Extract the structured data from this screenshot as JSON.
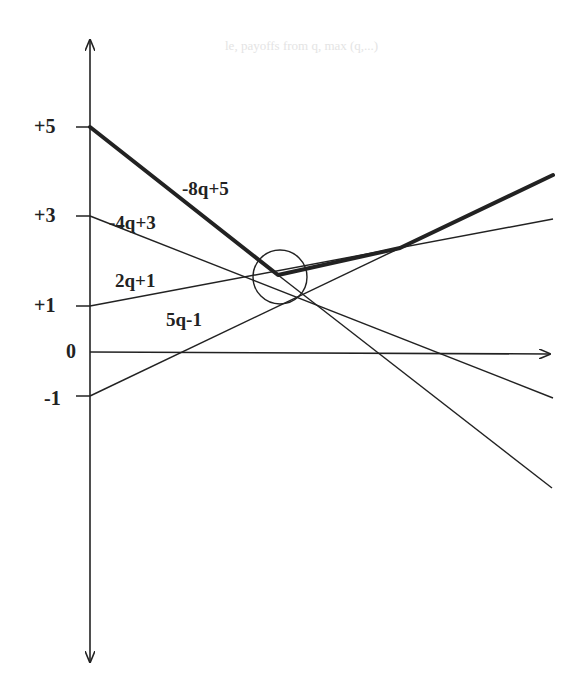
{
  "figure": {
    "axes": {
      "y_ticks": [
        {
          "label": "+5",
          "value": 5,
          "y": 127
        },
        {
          "label": "+3",
          "value": 3,
          "y": 216
        },
        {
          "label": "+1",
          "value": 1,
          "y": 306
        },
        {
          "label": "0",
          "value": 0,
          "y": 352
        },
        {
          "label": "-1",
          "value": -1,
          "y": 396
        }
      ]
    },
    "lines": [
      {
        "label": "-8q+5",
        "slope": -8,
        "intercept": 5,
        "emphasis": "upper-envelope segment"
      },
      {
        "label": "-4q+3",
        "slope": -4,
        "intercept": 3,
        "emphasis": "thin"
      },
      {
        "label": "2q+1",
        "slope": 2,
        "intercept": 1,
        "emphasis": "upper-envelope segment"
      },
      {
        "label": "5q-1",
        "slope": 5,
        "intercept": -1,
        "emphasis": "upper-envelope segment"
      }
    ],
    "annotation": {
      "type": "circle",
      "description": "minimum of upper envelope"
    },
    "colors": {
      "ink": "#222222",
      "background": "#ffffff",
      "bleed_text": "#e4e4e4"
    }
  },
  "background_bleed_text": [
    "le, payoffs from q, max (q,...)"
  ]
}
